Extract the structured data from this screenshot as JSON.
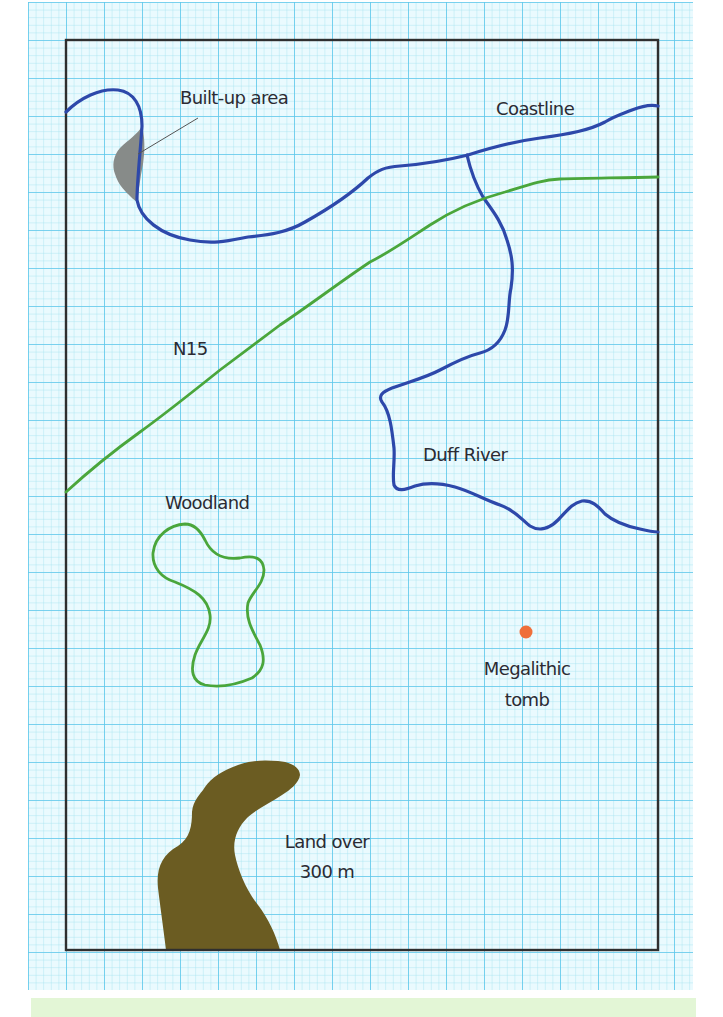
{
  "map": {
    "title": "Sketch map",
    "colors": {
      "grid_bg": "#e8f9fd",
      "grid_minor": "#9fe2f0",
      "grid_major": "#59c6ea",
      "frame": "#2f2f2f",
      "coastline": "#2a47a8",
      "river": "#2a47a8",
      "road": "#4aa63b",
      "woodland": "#4aa63b",
      "built_up": "#868a88",
      "high_land": "#6b5c22",
      "tomb": "#f0703a",
      "footer_band": "#e3f6d6"
    },
    "labels": {
      "built_up": "Built-up area",
      "coastline": "Coastline",
      "road": "N15",
      "river": "Duff River",
      "woodland": "Woodland",
      "tomb_line1": "Megalithic",
      "tomb_line2": "tomb",
      "land_line1": "Land over",
      "land_line2": "300 m"
    }
  }
}
